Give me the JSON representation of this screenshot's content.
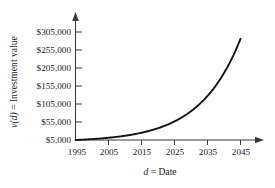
{
  "chart_data": {
    "type": "line",
    "title": "",
    "subtitle": "",
    "xlabel_parts": {
      "variable": "d",
      "rest": " = Date"
    },
    "ylabel_parts": {
      "variable": "v(d)",
      "rest": " = Investment value"
    },
    "xlabel": "d = Date",
    "ylabel": "v(d) = Investment value",
    "grid": false,
    "legend": false,
    "legend_position": "none",
    "xlim": [
      1995,
      2048
    ],
    "ylim": [
      5000,
      310000
    ],
    "xticks": [
      1995,
      2005,
      2015,
      2025,
      2035,
      2045
    ],
    "xtick_labels": [
      "1995",
      "2005",
      "2015",
      "2025",
      "2035",
      "2045"
    ],
    "yticks": [
      5000,
      55000,
      105000,
      155000,
      205000,
      255000,
      305000
    ],
    "ytick_labels": [
      "$5,000",
      "$55,000",
      "$105,000",
      "$155,000",
      "$205,000",
      "$255,000",
      "$305,000"
    ],
    "series": [
      {
        "name": "v(d) = Investment value",
        "color": "#141414",
        "x": [
          1995,
          2000,
          2005,
          2010,
          2015,
          2020,
          2025,
          2030,
          2035,
          2040,
          2045
        ],
        "values": [
          5000,
          7500,
          11200,
          16800,
          25200,
          37800,
          56600,
          84900,
          127300,
          190800,
          286000
        ]
      }
    ],
    "annotations": []
  },
  "axis_colors": {
    "axis": "#3a3a3a",
    "curve": "#141414",
    "background": "#ffffff"
  }
}
